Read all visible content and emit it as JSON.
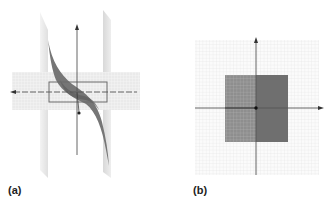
{
  "figure": {
    "panels": [
      {
        "id": "a",
        "label": "(a)",
        "description": "3D surface plot: cubic-shaped sheet intersecting a horizontal plane and two vertical planes, with a rectangular outline around the origin"
      },
      {
        "id": "b",
        "label": "(b)",
        "description": "2D grid with axes; shaded square region centered at origin, left half gridded/lighter, right half solid darker, with point at origin"
      }
    ]
  },
  "colors": {
    "surface_dark": "#707070",
    "surface_mid": "#8a8a8a",
    "plane_light": "#d8d8d8",
    "axis": "#555555",
    "grid": "#e4e4e4",
    "square_left": "#8f8f8f",
    "square_right": "#6e6e6e",
    "label": "#222222"
  }
}
